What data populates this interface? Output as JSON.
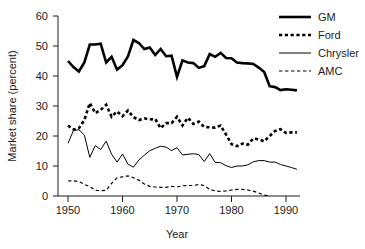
{
  "chart_data": {
    "type": "line",
    "title": "",
    "xlabel": "Year",
    "ylabel": "Market share (percent)",
    "xlim": [
      1949,
      1992
    ],
    "ylim": [
      0,
      60
    ],
    "xticks": [
      1950,
      1960,
      1970,
      1980,
      1990
    ],
    "yticks": [
      0,
      10,
      20,
      30,
      40,
      50,
      60
    ],
    "grid": false,
    "legend_position": "top-right",
    "x": [
      1950,
      1951,
      1952,
      1953,
      1954,
      1955,
      1956,
      1957,
      1958,
      1959,
      1960,
      1961,
      1962,
      1963,
      1964,
      1965,
      1966,
      1967,
      1968,
      1969,
      1970,
      1971,
      1972,
      1973,
      1974,
      1975,
      1976,
      1977,
      1978,
      1979,
      1980,
      1981,
      1982,
      1983,
      1984,
      1985,
      1986,
      1987,
      1988,
      1989,
      1990,
      1991,
      1992
    ],
    "series": [
      {
        "name": "GM",
        "style": "thick-solid",
        "color": "#000000",
        "values": [
          45.0,
          43.0,
          41.5,
          44.5,
          50.5,
          50.5,
          50.8,
          44.5,
          46.4,
          42.1,
          43.6,
          46.5,
          52.0,
          51.0,
          49.0,
          49.5,
          47.0,
          49.0,
          46.6,
          46.8,
          39.7,
          45.2,
          44.5,
          44.3,
          42.7,
          43.3,
          47.3,
          46.4,
          47.7,
          46.0,
          45.9,
          44.5,
          44.3,
          44.2,
          44.0,
          42.8,
          41.3,
          36.6,
          36.3,
          35.3,
          35.6,
          35.4,
          35.2
        ]
      },
      {
        "name": "Ford",
        "style": "thick-dashed",
        "color": "#000000",
        "values": [
          23.5,
          22.2,
          22.6,
          25.3,
          31.0,
          27.6,
          28.7,
          30.4,
          26.4,
          28.2,
          26.6,
          28.5,
          26.3,
          25.3,
          25.9,
          25.5,
          25.7,
          22.6,
          24.3,
          24.3,
          26.4,
          23.5,
          26.1,
          24.0,
          24.8,
          23.0,
          22.9,
          22.8,
          23.5,
          20.5,
          17.3,
          16.6,
          17.5,
          17.1,
          19.2,
          18.9,
          18.2,
          20.0,
          21.7,
          22.3,
          21.0,
          21.2,
          21.2
        ]
      },
      {
        "name": "Chrysler",
        "style": "thin-solid",
        "color": "#000000",
        "values": [
          17.6,
          21.8,
          22.1,
          20.3,
          12.9,
          16.8,
          15.5,
          18.3,
          13.9,
          11.3,
          14.0,
          10.6,
          9.6,
          12.0,
          13.6,
          15.1,
          15.9,
          16.6,
          16.3,
          15.1,
          16.1,
          13.7,
          13.9,
          14.1,
          13.8,
          11.5,
          14.1,
          11.2,
          11.1,
          10.1,
          9.5,
          10.0,
          10.0,
          10.4,
          11.4,
          11.8,
          11.8,
          11.3,
          11.3,
          10.5,
          10.0,
          9.5,
          8.9
        ]
      },
      {
        "name": "AMC",
        "style": "thin-dashed",
        "color": "#000000",
        "values": [
          5.0,
          5.1,
          4.8,
          3.9,
          3.1,
          1.9,
          1.8,
          1.9,
          4.2,
          6.1,
          6.4,
          6.7,
          6.1,
          5.3,
          4.0,
          3.2,
          3.0,
          2.9,
          2.9,
          3.2,
          3.0,
          3.4,
          3.5,
          3.5,
          3.8,
          3.5,
          2.2,
          1.7,
          1.5,
          1.7,
          2.0,
          2.2,
          2.2,
          2.0,
          1.6,
          1.0,
          0.3,
          0.0,
          0.0,
          0.0,
          0.0,
          0.0,
          0.0
        ]
      }
    ]
  },
  "legend": {
    "items": [
      {
        "label": "GM"
      },
      {
        "label": "Ford"
      },
      {
        "label": "Chrysler"
      },
      {
        "label": "AMC"
      }
    ]
  },
  "axes": {
    "y_label": "Market share (percent)",
    "x_label": "Year",
    "y_tick_labels": [
      "0",
      "10",
      "20",
      "30",
      "40",
      "50",
      "60"
    ],
    "x_tick_labels": [
      "1950",
      "1960",
      "1970",
      "1980",
      "1990"
    ]
  }
}
